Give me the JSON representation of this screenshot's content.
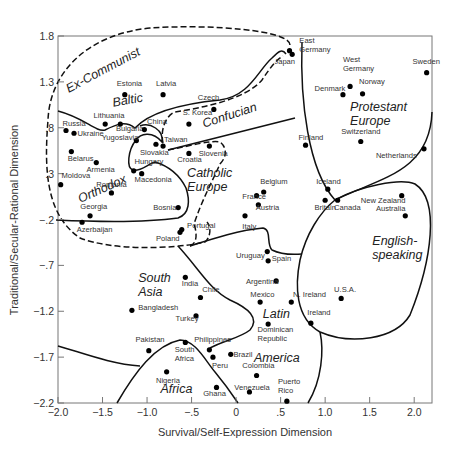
{
  "chart_data": {
    "type": "scatter",
    "title": "",
    "xlabel": "Survival/Self-Expression Dimension",
    "ylabel": "Traditional/Secular-Rational Dimension",
    "xlim": [
      -2.0,
      2.2
    ],
    "ylim": [
      -2.2,
      1.8
    ],
    "grid": false,
    "x_ticks": [
      {
        "value": -2.0,
        "label": "−2.0"
      },
      {
        "value": -1.5,
        "label": "−1.5"
      },
      {
        "value": -1.0,
        "label": "−1.0"
      },
      {
        "value": -0.5,
        "label": "−.5"
      },
      {
        "value": 0,
        "label": "0"
      },
      {
        "value": 0.5,
        "label": ".5"
      },
      {
        "value": 1.0,
        "label": "1.0"
      },
      {
        "value": 1.5,
        "label": "1.5"
      },
      {
        "value": 2.0,
        "label": "2.0"
      }
    ],
    "y_ticks": [
      {
        "value": 1.8,
        "label": "1.8"
      },
      {
        "value": 1.3,
        "label": "1.3"
      },
      {
        "value": 0.8,
        "label": ".8"
      },
      {
        "value": 0.3,
        "label": ".3"
      },
      {
        "value": -0.2,
        "label": "−.2"
      },
      {
        "value": -0.7,
        "label": "−.7"
      },
      {
        "value": -1.2,
        "label": "−1.2"
      },
      {
        "value": -1.7,
        "label": "−1.7"
      },
      {
        "value": -2.2,
        "label": "−2.2"
      }
    ],
    "points": [
      {
        "name": "East Germany",
        "label": [
          "East",
          "Germany"
        ],
        "x": 0.6,
        "y": 1.64,
        "lx": 0.71,
        "ly": 1.72,
        "anchor": "start"
      },
      {
        "name": "Japan",
        "label": [
          "Japan"
        ],
        "x": 0.63,
        "y": 1.6,
        "lx": 0.43,
        "ly": 1.5,
        "anchor": "start"
      },
      {
        "name": "Sweden",
        "label": [
          "Sweden"
        ],
        "x": 2.14,
        "y": 1.4,
        "lx": 1.98,
        "ly": 1.5,
        "anchor": "start"
      },
      {
        "name": "West Germany",
        "label": [
          "West",
          "Germany"
        ],
        "x": 1.28,
        "y": 1.25,
        "lx": 1.2,
        "ly": 1.52,
        "anchor": "start"
      },
      {
        "name": "Denmark",
        "label": [
          "Denmark"
        ],
        "x": 1.2,
        "y": 1.16,
        "lx": 0.88,
        "ly": 1.2,
        "anchor": "start"
      },
      {
        "name": "Norway",
        "label": [
          "Norway"
        ],
        "x": 1.42,
        "y": 1.17,
        "lx": 1.38,
        "ly": 1.28,
        "anchor": "start"
      },
      {
        "name": "Estonia",
        "label": [
          "Estonia"
        ],
        "x": -1.25,
        "y": 1.16,
        "lx": -1.34,
        "ly": 1.25,
        "anchor": "start"
      },
      {
        "name": "Latvia",
        "label": [
          "Latvia"
        ],
        "x": -0.82,
        "y": 1.16,
        "lx": -0.9,
        "ly": 1.25,
        "anchor": "start"
      },
      {
        "name": "Czech",
        "label": [
          "Czech"
        ],
        "x": -0.25,
        "y": 1.0,
        "lx": -0.43,
        "ly": 1.1,
        "anchor": "start"
      },
      {
        "name": "Russia",
        "label": [
          "Russia"
        ],
        "x": -1.91,
        "y": 0.77,
        "lx": -1.95,
        "ly": 0.82,
        "anchor": "start"
      },
      {
        "name": "Lithuania",
        "label": [
          "Lithuania"
        ],
        "x": -1.47,
        "y": 0.84,
        "lx": -1.6,
        "ly": 0.91,
        "anchor": "start"
      },
      {
        "name": "Bulgaria",
        "label": [
          "Bulgaria"
        ],
        "x": -1.3,
        "y": 0.84,
        "lx": -1.35,
        "ly": 0.77,
        "anchor": "start"
      },
      {
        "name": "Ukraine",
        "label": [
          "Ukraine"
        ],
        "x": -1.82,
        "y": 0.74,
        "lx": -1.78,
        "ly": 0.71,
        "anchor": "start"
      },
      {
        "name": "China",
        "label": [
          "China"
        ],
        "x": -1.03,
        "y": 0.78,
        "lx": -1.0,
        "ly": 0.84,
        "anchor": "start"
      },
      {
        "name": "S. Korea",
        "label": [
          "S. Korea"
        ],
        "x": -0.53,
        "y": 0.84,
        "lx": -0.6,
        "ly": 0.94,
        "anchor": "start"
      },
      {
        "name": "Yugoslavia",
        "label": [
          "Yugoslavia"
        ],
        "x": -1.12,
        "y": 0.66,
        "lx": -1.51,
        "ly": 0.67,
        "anchor": "start"
      },
      {
        "name": "Taiwan",
        "label": [
          "Taiwan"
        ],
        "x": -0.82,
        "y": 0.6,
        "lx": -0.81,
        "ly": 0.64,
        "anchor": "start"
      },
      {
        "name": "Slovakia",
        "label": [
          "Slovakia"
        ],
        "x": -0.9,
        "y": 0.62,
        "lx": -1.08,
        "ly": 0.5,
        "anchor": "start"
      },
      {
        "name": "Belarus",
        "label": [
          "Belarus"
        ],
        "x": -1.85,
        "y": 0.54,
        "lx": -1.89,
        "ly": 0.44,
        "anchor": "start"
      },
      {
        "name": "Croatia",
        "label": [
          "Croatia"
        ],
        "x": -0.53,
        "y": 0.52,
        "lx": -0.66,
        "ly": 0.43,
        "anchor": "start"
      },
      {
        "name": "Slovenia",
        "label": [
          "Slovenia"
        ],
        "x": -0.3,
        "y": 0.6,
        "lx": -0.42,
        "ly": 0.49,
        "anchor": "start"
      },
      {
        "name": "Armenia",
        "label": [
          "Armenia"
        ],
        "x": -1.57,
        "y": 0.42,
        "lx": -1.68,
        "ly": 0.32,
        "anchor": "start"
      },
      {
        "name": "Hungary",
        "label": [
          "Hungary"
        ],
        "x": -1.15,
        "y": 0.33,
        "lx": -1.14,
        "ly": 0.41,
        "anchor": "start"
      },
      {
        "name": "Macedonia",
        "label": [
          "Macedonia"
        ],
        "x": -1.06,
        "y": 0.3,
        "lx": -1.14,
        "ly": 0.21,
        "anchor": "start"
      },
      {
        "name": "Moldova",
        "label": [
          "Moldova"
        ],
        "x": -1.97,
        "y": 0.18,
        "lx": -1.96,
        "ly": 0.25,
        "anchor": "start"
      },
      {
        "name": "Romania",
        "label": [
          "Romania"
        ],
        "x": -1.4,
        "y": 0.09,
        "lx": -1.57,
        "ly": 0.15,
        "anchor": "start"
      },
      {
        "name": "Bosnia",
        "label": [
          "Bosnia"
        ],
        "x": -0.65,
        "y": -0.07,
        "lx": -0.93,
        "ly": -0.1,
        "anchor": "start"
      },
      {
        "name": "Georgia",
        "label": [
          "Georgia"
        ],
        "x": -1.64,
        "y": -0.16,
        "lx": -1.75,
        "ly": -0.09,
        "anchor": "start"
      },
      {
        "name": "Azerbaijan",
        "label": [
          "Azerbaijan"
        ],
        "x": -1.73,
        "y": -0.23,
        "lx": -1.79,
        "ly": -0.34,
        "anchor": "start"
      },
      {
        "name": "Portugal",
        "label": [
          "Portugal"
        ],
        "x": -0.61,
        "y": -0.31,
        "lx": -0.55,
        "ly": -0.29,
        "anchor": "start"
      },
      {
        "name": "Poland",
        "label": [
          "Poland"
        ],
        "x": -0.63,
        "y": -0.34,
        "lx": -0.9,
        "ly": -0.43,
        "anchor": "start"
      },
      {
        "name": "Belgium",
        "label": [
          "Belgium"
        ],
        "x": 0.31,
        "y": 0.1,
        "lx": 0.27,
        "ly": 0.19,
        "anchor": "start"
      },
      {
        "name": "France",
        "label": [
          "France"
        ],
        "x": 0.23,
        "y": 0.06,
        "lx": 0.07,
        "ly": 0.02,
        "anchor": "start"
      },
      {
        "name": "Austria",
        "label": [
          "Austria"
        ],
        "x": 0.25,
        "y": -0.04,
        "lx": 0.22,
        "ly": -0.1,
        "anchor": "start"
      },
      {
        "name": "Italy",
        "label": [
          "Italy"
        ],
        "x": 0.1,
        "y": -0.16,
        "lx": 0.07,
        "ly": -0.3,
        "anchor": "start"
      },
      {
        "name": "Finland",
        "label": [
          "Finland"
        ],
        "x": 0.78,
        "y": 0.61,
        "lx": 0.7,
        "ly": 0.67,
        "anchor": "start"
      },
      {
        "name": "Switzerland",
        "label": [
          "Switzerland"
        ],
        "x": 1.4,
        "y": 0.65,
        "lx": 1.18,
        "ly": 0.73,
        "anchor": "start"
      },
      {
        "name": "Netherlands",
        "label": [
          "Netherlands"
        ],
        "x": 2.11,
        "y": 0.57,
        "lx": 1.57,
        "ly": 0.47,
        "anchor": "start"
      },
      {
        "name": "Iceland",
        "label": [
          "Iceland"
        ],
        "x": 1.03,
        "y": 0.13,
        "lx": 0.9,
        "ly": 0.19,
        "anchor": "start"
      },
      {
        "name": "Britain",
        "label": [
          "Britain"
        ],
        "x": 1.0,
        "y": 0.01,
        "lx": 0.88,
        "ly": -0.1,
        "anchor": "start"
      },
      {
        "name": "Canada",
        "label": [
          "Canada"
        ],
        "x": 1.14,
        "y": 0.01,
        "lx": 1.1,
        "ly": -0.1,
        "anchor": "start"
      },
      {
        "name": "New Zealand",
        "label": [
          "New Zealand"
        ],
        "x": 1.86,
        "y": 0.06,
        "lx": 1.4,
        "ly": -0.02,
        "anchor": "start"
      },
      {
        "name": "Australia",
        "label": [
          "Australia"
        ],
        "x": 1.9,
        "y": -0.16,
        "lx": 1.57,
        "ly": -0.11,
        "anchor": "start"
      },
      {
        "name": "Uruguay",
        "label": [
          "Uruguay"
        ],
        "x": 0.35,
        "y": -0.55,
        "lx": 0.0,
        "ly": -0.62,
        "anchor": "start"
      },
      {
        "name": "Spain",
        "label": [
          "Spain"
        ],
        "x": 0.36,
        "y": -0.65,
        "lx": 0.4,
        "ly": -0.65,
        "anchor": "start"
      },
      {
        "name": "Argentina",
        "label": [
          "Argentina"
        ],
        "x": 0.45,
        "y": -0.87,
        "lx": 0.11,
        "ly": -0.9,
        "anchor": "start"
      },
      {
        "name": "India",
        "label": [
          "India"
        ],
        "x": -0.57,
        "y": -0.83,
        "lx": -0.61,
        "ly": -0.93,
        "anchor": "start"
      },
      {
        "name": "Chile",
        "label": [
          "Chile"
        ],
        "x": -0.4,
        "y": -1.05,
        "lx": -0.38,
        "ly": -0.99,
        "anchor": "start"
      },
      {
        "name": "Mexico",
        "label": [
          "Mexico"
        ],
        "x": 0.27,
        "y": -1.1,
        "lx": 0.16,
        "ly": -1.04,
        "anchor": "start"
      },
      {
        "name": "Bangladesh",
        "label": [
          "Bangladesh"
        ],
        "x": -1.17,
        "y": -1.19,
        "lx": -1.1,
        "ly": -1.19,
        "anchor": "start"
      },
      {
        "name": "N. Ireland",
        "label": [
          "N. Ireland"
        ],
        "x": 0.62,
        "y": -1.1,
        "lx": 0.64,
        "ly": -1.04,
        "anchor": "start"
      },
      {
        "name": "U.S.A.",
        "label": [
          "U.S.A."
        ],
        "x": 1.18,
        "y": -1.06,
        "lx": 1.1,
        "ly": -0.99,
        "anchor": "start"
      },
      {
        "name": "Ireland",
        "label": [
          "Ireland"
        ],
        "x": 0.84,
        "y": -1.33,
        "lx": 0.8,
        "ly": -1.24,
        "anchor": "start"
      },
      {
        "name": "Turkey",
        "label": [
          "Turkey"
        ],
        "x": -0.45,
        "y": -1.25,
        "lx": -0.68,
        "ly": -1.31,
        "anchor": "start"
      },
      {
        "name": "Dominican Republic",
        "label": [
          "Dominican",
          "Republic"
        ],
        "x": 0.36,
        "y": -1.34,
        "lx": 0.24,
        "ly": -1.43,
        "anchor": "start"
      },
      {
        "name": "Pakistan",
        "label": [
          "Pakistan"
        ],
        "x": -0.98,
        "y": -1.63,
        "lx": -1.13,
        "ly": -1.54,
        "anchor": "start"
      },
      {
        "name": "South Africa",
        "label": [
          "South",
          "Africa"
        ],
        "x": -0.57,
        "y": -1.54,
        "lx": -0.69,
        "ly": -1.64,
        "anchor": "start"
      },
      {
        "name": "Philippines",
        "label": [
          "Philippines"
        ],
        "x": -0.3,
        "y": -1.62,
        "lx": -0.47,
        "ly": -1.53,
        "anchor": "start"
      },
      {
        "name": "Peru",
        "label": [
          "Peru"
        ],
        "x": -0.26,
        "y": -1.7,
        "lx": -0.27,
        "ly": -1.82,
        "anchor": "start"
      },
      {
        "name": "Brazil",
        "label": [
          "Brazil"
        ],
        "x": -0.06,
        "y": -1.67,
        "lx": -0.03,
        "ly": -1.7,
        "anchor": "start"
      },
      {
        "name": "Nigeria",
        "label": [
          "Nigeria"
        ],
        "x": -0.78,
        "y": -1.86,
        "lx": -0.9,
        "ly": -1.98,
        "anchor": "start"
      },
      {
        "name": "Colombia",
        "label": [
          "Colombia"
        ],
        "x": 0.23,
        "y": -1.9,
        "lx": 0.07,
        "ly": -1.82,
        "anchor": "start"
      },
      {
        "name": "Ghana",
        "label": [
          "Ghana"
        ],
        "x": -0.22,
        "y": -2.03,
        "lx": -0.37,
        "ly": -2.12,
        "anchor": "start"
      },
      {
        "name": "Venezuela",
        "label": [
          "Venezuela"
        ],
        "x": 0.15,
        "y": -2.08,
        "lx": -0.02,
        "ly": -2.06,
        "anchor": "start"
      },
      {
        "name": "Puerto Rico",
        "label": [
          "Puerto",
          "Rico"
        ],
        "x": 0.57,
        "y": -2.18,
        "lx": 0.47,
        "ly": -1.99,
        "anchor": "start"
      }
    ],
    "regions": [
      {
        "name": "Ex-Communist",
        "label": [
          "Ex-Communist"
        ],
        "x": -1.88,
        "y": 1.18,
        "rotate": -28,
        "boundary": "dashed"
      },
      {
        "name": "Baltic",
        "label": [
          "Baltic"
        ],
        "x": -1.38,
        "y": 1.03,
        "rotate": -10,
        "boundary": "solid"
      },
      {
        "name": "Confucian",
        "label": [
          "Confucian"
        ],
        "x": -0.36,
        "y": 0.8,
        "rotate": -18,
        "boundary": "dashed"
      },
      {
        "name": "Orthodox",
        "label": [
          "Orthodox"
        ],
        "x": -1.75,
        "y": -0.02,
        "rotate": -24,
        "boundary": "solid"
      },
      {
        "name": "Catholic Europe",
        "label": [
          "Catholic",
          "Europe"
        ],
        "x": -0.55,
        "y": 0.26,
        "rotate": 0,
        "boundary": "dashed"
      },
      {
        "name": "Protestant Europe",
        "label": [
          "Protestant",
          "Europe"
        ],
        "x": 1.28,
        "y": 0.98,
        "rotate": 0,
        "boundary": "solid"
      },
      {
        "name": "English-speaking",
        "label": [
          "English-",
          "speaking"
        ],
        "x": 1.53,
        "y": -0.48,
        "rotate": 0,
        "boundary": "solid"
      },
      {
        "name": "South Asia",
        "label": [
          "South",
          "Asia"
        ],
        "x": -1.1,
        "y": -0.88,
        "rotate": 0,
        "boundary": "solid"
      },
      {
        "name": "Latin America",
        "label": [
          "Latin"
        ],
        "x": 0.3,
        "y": -1.27,
        "rotate": 0,
        "boundary": "solid"
      },
      {
        "name": "Latin America (2)",
        "label": [
          "America"
        ],
        "x": 0.2,
        "y": -1.75,
        "rotate": 0,
        "boundary": "solid"
      },
      {
        "name": "Africa",
        "label": [
          "Africa"
        ],
        "x": -0.85,
        "y": -2.09,
        "rotate": 0,
        "boundary": "solid"
      }
    ]
  }
}
